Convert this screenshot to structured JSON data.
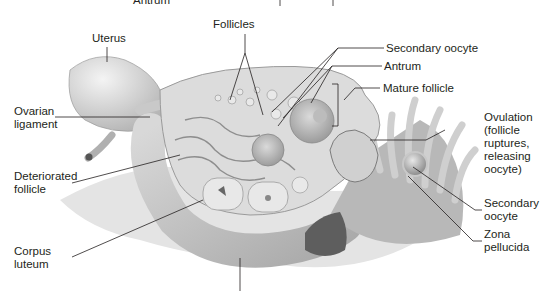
{
  "diagram": {
    "labels": {
      "antrum_top": "Antrum",
      "uterus": "Uterus",
      "follicles": "Follicles",
      "secondary_oocyte_top": "Secondary oocyte",
      "antrum": "Antrum",
      "mature_follicle": "Mature follicle",
      "ovarian_ligament": "Ovarian\nligament",
      "ovulation": "Ovulation\n(follicle\nruptures,\nreleasing\noocyte)",
      "deteriorated_follicle": "Deteriorated\nfollicle",
      "secondary_oocyte_right": "Secondary\noocyte",
      "zona_pellucida": "Zona\npellucida",
      "corpus_luteum": "Corpus\nluteum"
    },
    "colors": {
      "line": "#231f20",
      "tissue_light": "#e6e6e6",
      "tissue_mid": "#c8c8c8",
      "tissue_dark": "#8c8c8c"
    }
  }
}
